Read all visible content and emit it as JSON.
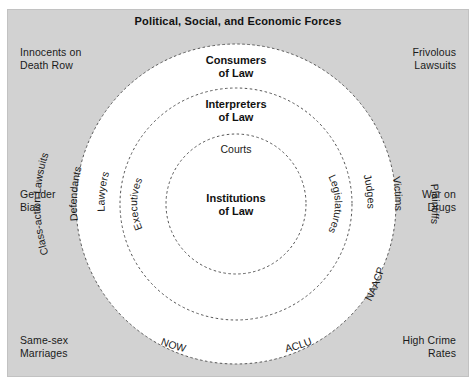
{
  "diagram": {
    "title": "Political, Social, and Economic Forces",
    "background_color": "#d2d2d2",
    "circle_fill": "#ffffff",
    "border_style": "dashed",
    "center": {
      "x": 236,
      "y": 204
    },
    "radii": {
      "outer": 160,
      "middle": 116,
      "inner": 70
    }
  },
  "corner_labels": {
    "top_left": "Innocents on\nDeath Row",
    "top_right": "Frivolous\nLawsuits",
    "middle_left": "Gender\nBias",
    "middle_right": "War on\nDrugs",
    "bottom_left": "Same-sex\nMarriages",
    "bottom_right": "High Crime\nRates"
  },
  "rings": [
    {
      "name": "outer",
      "title": "Consumers\nof Law",
      "items": [
        {
          "label": "Defendants",
          "position": "upper-left"
        },
        {
          "label": "Victims",
          "position": "upper-right"
        },
        {
          "label": "Class-action Lawsuits",
          "position": "left"
        },
        {
          "label": "Plaintiffs",
          "position": "right"
        },
        {
          "label": "NOW",
          "position": "lower-left"
        },
        {
          "label": "ACLU",
          "position": "lower-right"
        },
        {
          "label": "NAACP",
          "position": "right-lower"
        }
      ]
    },
    {
      "name": "middle",
      "title": "Interpreters\nof Law",
      "items": [
        {
          "label": "Lawyers",
          "position": "upper-left"
        },
        {
          "label": "Judges",
          "position": "upper-right"
        }
      ]
    },
    {
      "name": "inner",
      "title": "Institutions\nof Law",
      "items": [
        {
          "label": "Courts",
          "position": "top"
        },
        {
          "label": "Executives",
          "position": "left"
        },
        {
          "label": "Legislatures",
          "position": "right"
        }
      ]
    }
  ]
}
